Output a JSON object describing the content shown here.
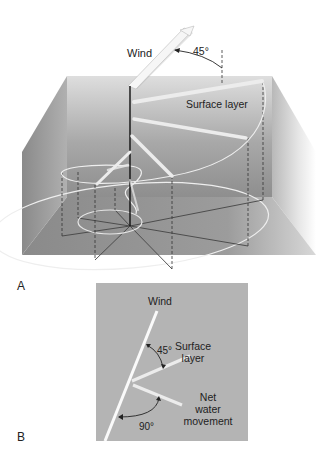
{
  "figure": {
    "panel_a": {
      "letter": "A",
      "labels": {
        "wind": "Wind",
        "angle": "45°",
        "surface_layer": "Surface layer"
      }
    },
    "panel_b": {
      "letter": "B",
      "labels": {
        "wind": "Wind",
        "angle_surface": "45°",
        "surface_layer_line1": "Surface",
        "surface_layer_line2": "layer",
        "net_line1": "Net",
        "net_line2": "water",
        "net_line3": "movement",
        "angle_net": "90°"
      },
      "angles_deg": {
        "surface_layer_from_wind": 45,
        "net_water_movement_from_wind": 90
      }
    },
    "colors": {
      "background": "#ffffff",
      "box_wall": "#9a9a9a",
      "box_floor": "#8c8c8c",
      "panel_b_bg": "#b4b4b4",
      "arrows": "#f2f2f2",
      "axis": "#111111",
      "text": "#222222"
    }
  }
}
